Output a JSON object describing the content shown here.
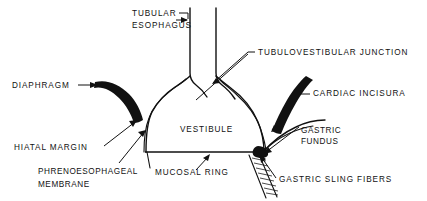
{
  "figure": {
    "type": "anatomical-line-diagram",
    "background_color": "#ffffff",
    "ink_color": "#111111",
    "width": 427,
    "height": 201
  },
  "labels": {
    "tubular_esophagus": {
      "line1": "TUBULAR",
      "line2": "ESOPHAGUS",
      "x": 132,
      "y": 16,
      "anchor": "start",
      "points_to": "esophagus-tube"
    },
    "tubulovestibular_junction": {
      "text": "TUBULOVESTIBULAR   JUNCTION",
      "x": 258,
      "y": 55,
      "anchor": "start",
      "points_to": "tubulovestibular-junction-notch"
    },
    "diaphragm": {
      "text": "DIAPHRAGM",
      "x": 12,
      "y": 88,
      "anchor": "start",
      "points_to": "diaphragm-muscle-left"
    },
    "cardiac_incisura": {
      "text": "CARDIAC   INCISURA",
      "x": 313,
      "y": 96,
      "anchor": "start",
      "points_to": "cardiac-incisura-muscle"
    },
    "vestibule": {
      "text": "VESTIBULE",
      "x": 180,
      "y": 132,
      "anchor": "start",
      "points_to": "vestibule-cavity"
    },
    "hiatal_margin": {
      "text": "HIATAL   MARGIN",
      "x": 14,
      "y": 150,
      "anchor": "start",
      "points_to": "hiatal-margin-point"
    },
    "gastric_fundus": {
      "line1": "GASTRIC",
      "line2": "FUNDUS",
      "x": 301,
      "y": 133,
      "anchor": "start",
      "points_to": "gastric-fundus-wall"
    },
    "phrenoesophageal_membrane": {
      "line1": "PHRENOESOPHAGEAL",
      "line2": "MEMBRANE",
      "x": 38,
      "y": 174,
      "anchor": "start",
      "points_to": "phrenoesophageal-membrane-point"
    },
    "mucosal_ring": {
      "text": "MUCOSAL   RING",
      "x": 155,
      "y": 175,
      "anchor": "start",
      "points_to": "mucosal-ring-line"
    },
    "gastric_sling_fibers": {
      "text": "GASTRIC   SLING   FIBERS",
      "x": 279,
      "y": 182,
      "anchor": "start",
      "points_to": "gastric-sling-fibers-bundle"
    }
  },
  "structures": {
    "esophagus_tube": {
      "name": "esophagus-tube",
      "description": "vertical tubular esophagus walls"
    },
    "vestibule_cavity": {
      "name": "vestibule-cavity",
      "description": "flask shaped vestibule chamber"
    },
    "diaphragm_muscle_left": {
      "name": "diaphragm-muscle-left",
      "description": "solid black curved diaphragm wedge, left"
    },
    "cardiac_incisura_muscle": {
      "name": "cardiac-incisura-muscle",
      "description": "solid black curved wedge, right"
    },
    "gastric_sling_fibers_bundle": {
      "name": "gastric-sling-fibers-bundle",
      "description": "hatched diagonal fiber bundle below junction"
    },
    "mucosal_ring_line": {
      "name": "mucosal-ring-line",
      "description": "horizontal line at base of vestibule"
    }
  }
}
